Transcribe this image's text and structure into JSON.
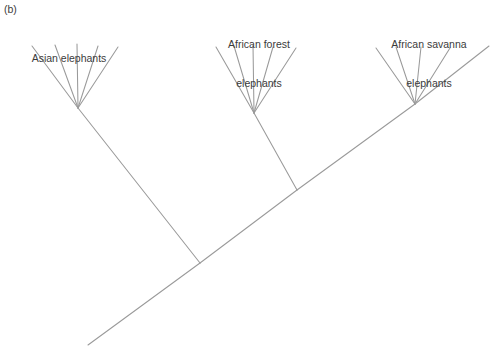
{
  "figure": {
    "panel_label": "(b)",
    "background_color": "#ffffff",
    "line_color": "#9a9a9a",
    "text_color": "#3b3b3b",
    "width": 498,
    "height": 349
  },
  "labels": {
    "asian": {
      "line1": "Asian elephants",
      "line2": "",
      "x": 69,
      "y": 26
    },
    "african_forest": {
      "line1": "African forest",
      "line2": "elephants",
      "x": 259,
      "y": 12
    },
    "african_savanna": {
      "line1": "African savanna",
      "line2": "elephants",
      "x": 429,
      "y": 12
    }
  },
  "chart_data": {
    "type": "diagram",
    "diagram_kind": "phylogenetic-tree",
    "title": "(b)",
    "clades": [
      {
        "name": "Asian elephants",
        "node": [
          78,
          108
        ],
        "tip_count": 5,
        "tips": [
          [
            32,
            46
          ],
          [
            55,
            45
          ],
          [
            77,
            44
          ],
          [
            98,
            46
          ],
          [
            118,
            47
          ]
        ]
      },
      {
        "name": "African forest elephants",
        "node": [
          254,
          113
        ],
        "tip_count": 5,
        "tips": [
          [
            216,
            47
          ],
          [
            234,
            46
          ],
          [
            253,
            45
          ],
          [
            273,
            47
          ],
          [
            296,
            48
          ]
        ]
      },
      {
        "name": "African savanna elephants",
        "node": [
          415,
          104
        ],
        "tip_count": 4,
        "tips": [
          [
            376,
            48
          ],
          [
            396,
            47
          ],
          [
            421,
            47
          ],
          [
            450,
            48
          ]
        ]
      }
    ],
    "internal_nodes": [
      {
        "name": "root-node",
        "point": [
          200,
          263
        ]
      },
      {
        "name": "african-split-node",
        "point": [
          297,
          190
        ]
      }
    ],
    "root_tip": [
      88,
      345
    ],
    "savanna_backbone_tip": [
      489,
      46
    ],
    "backbone_edges": [
      {
        "from": [
          88,
          345
        ],
        "to": [
          200,
          263
        ],
        "name": "root-to-basal-node"
      },
      {
        "from": [
          200,
          263
        ],
        "to": [
          78,
          108
        ],
        "name": "basal-node-to-asian-clade"
      },
      {
        "from": [
          200,
          263
        ],
        "to": [
          297,
          190
        ],
        "name": "basal-node-to-african-node"
      },
      {
        "from": [
          297,
          190
        ],
        "to": [
          254,
          113
        ],
        "name": "african-node-to-forest-clade"
      },
      {
        "from": [
          297,
          190
        ],
        "to": [
          415,
          104
        ],
        "name": "african-node-to-savanna-clade"
      },
      {
        "from": [
          415,
          104
        ],
        "to": [
          489,
          46
        ],
        "name": "savanna-clade-extension"
      }
    ]
  }
}
